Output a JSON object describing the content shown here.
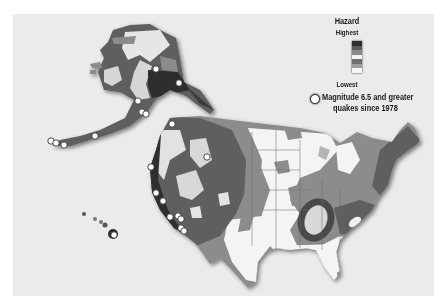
{
  "legend": {
    "title": "Hazard",
    "high_label": "Highest",
    "low_label": "Lowest",
    "scale_colors": [
      "#2e2e2e",
      "#5a5a5a",
      "#8a8a8a",
      "#f4f4f4",
      "#6e6e6e",
      "#9c9c9c",
      "#f6f6f6"
    ],
    "quake_marker_line1": "Magnitude 6.5 and greater",
    "quake_marker_line2": "quakes since 1978"
  },
  "colors": {
    "background": "#ffffff",
    "panel": "#ebebeb",
    "hazard_highest": "#3a3a3a",
    "hazard_high": "#5e5e5e",
    "hazard_moderate": "#8c8c8c",
    "hazard_low": "#b4b4b4",
    "hazard_lowest": "#f5f5f5",
    "quake_marker": "#ffffff"
  },
  "quakes": {
    "alaska": [
      [
        156,
        69
      ],
      [
        179,
        83
      ],
      [
        138,
        101
      ],
      [
        142,
        112
      ],
      [
        146,
        114
      ],
      [
        95,
        136
      ],
      [
        51,
        141
      ],
      [
        56,
        143
      ],
      [
        64,
        145
      ]
    ],
    "conus": [
      [
        172,
        124
      ],
      [
        207,
        157
      ],
      [
        151,
        167
      ],
      [
        156,
        193
      ],
      [
        163,
        201
      ],
      [
        170,
        217
      ],
      [
        178,
        216
      ],
      [
        181,
        219
      ],
      [
        181,
        228
      ],
      [
        184,
        231
      ]
    ],
    "hawaii": [
      [
        114,
        235
      ]
    ]
  }
}
